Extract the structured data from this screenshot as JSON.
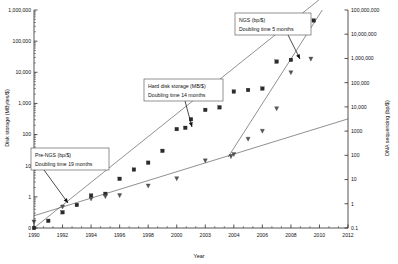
{
  "chart_data": {
    "type": "scatter",
    "title": "",
    "xlabel": "Year",
    "ylabel": "Disk storage (MBytes/$)",
    "y2label": "DNA sequencing (bp/$)",
    "grid": false,
    "legend": "none",
    "x_axis": {
      "label": "Year",
      "min": 1990,
      "max": 2012,
      "ticks": [
        "1990",
        "1992",
        "1994",
        "1996",
        "1998",
        "2000",
        "2003",
        "2004",
        "2006",
        "2008",
        "2010",
        "2012"
      ],
      "tick_values": [
        1990,
        1992,
        1994,
        1996,
        1998,
        2000,
        2002,
        2004,
        2006,
        2008,
        2010,
        2012
      ],
      "minor_ticks_per_interval": 2
    },
    "y_axis_left": {
      "label": "Disk storage (MBytes/$)",
      "scale": "log",
      "min": 0.1,
      "max": 1000000,
      "ticks": [
        "0",
        "1",
        "10",
        "100",
        "1,000",
        "10,000",
        "100,000",
        "1,000,000"
      ],
      "tick_values": [
        0.1,
        1,
        10,
        100,
        1000,
        10000,
        100000,
        1000000
      ]
    },
    "y_axis_right": {
      "label": "DNA sequencing (bp/$)",
      "scale": "log",
      "min": 0.1,
      "max": 100000000,
      "ticks": [
        "0.1",
        "1",
        "10",
        "100",
        "1000",
        "10,000",
        "100,000",
        "1,000,000",
        "10,000,000",
        "100,000,000"
      ],
      "tick_values": [
        0.1,
        1,
        10,
        100,
        1000,
        10000,
        100000,
        1000000,
        10000000,
        100000000
      ]
    },
    "series": [
      {
        "name": "Hard disk storage (MB/$)",
        "marker": "square",
        "axis": "left",
        "x": [
          1990,
          1991,
          1992,
          1993,
          1994,
          1995,
          1996,
          1997,
          1998,
          1999,
          2000,
          2000.6,
          2001,
          2002,
          2003,
          2004,
          2005,
          2006,
          2007,
          2008,
          2009,
          2009.6
        ],
        "y": [
          0.1,
          0.17,
          0.32,
          0.55,
          1.1,
          1.25,
          3.8,
          7.5,
          12.5,
          30,
          150,
          165,
          310,
          620,
          750,
          2400,
          2700,
          3000,
          22000,
          25000,
          260000,
          460000
        ]
      },
      {
        "name": "DNA sequencing (bp/$)",
        "marker": "triangle",
        "axis": "right",
        "x": [
          1990,
          1992,
          1994,
          1995,
          1996,
          1998,
          2000,
          2002,
          2003.8,
          2004,
          2005,
          2006,
          2007,
          2008,
          2009.4
        ],
        "y": [
          0.18,
          0.75,
          1.6,
          2.0,
          2.2,
          5.5,
          11,
          60,
          90,
          110,
          470,
          1000,
          8500,
          260000,
          950000
        ]
      }
    ],
    "trend_lines": [
      {
        "name": "Pre-NGS trend",
        "label": "Pre-NGS (bp/$)",
        "doubling_time": "Doubling time 19 months",
        "axis": "right",
        "x0": 1990,
        "y0": 0.32,
        "x1": 2012,
        "y1": 3200
      },
      {
        "name": "Hard disk trend",
        "label": "Hard disk storage (MB/$)",
        "doubling_time": "Doubling time 14 months",
        "axis": "left",
        "x0": 1990,
        "y0": 0.1,
        "x1": 2011.2,
        "y1": 6000000
      },
      {
        "name": "NGS trend",
        "label": "NGS (bp/$)",
        "doubling_time": "Doubling time 5 months",
        "axis": "right",
        "x0": 2003.6,
        "y0": 85,
        "x1": 2010.2,
        "y1": 100000000
      }
    ],
    "annotations": [
      {
        "id": "pre-ngs",
        "line1": "Pre-NGS (bp/$)",
        "line2": "Doubling time 19 months",
        "box": {
          "x": 31,
          "y": 148,
          "w": 78,
          "h": 22
        },
        "arrow_from": {
          "x": 44,
          "y": 170
        },
        "arrow_to": {
          "x": 68,
          "y": 203
        }
      },
      {
        "id": "hard-disk",
        "line1": "Hard disk storage (MB/$)",
        "line2": "Doubling time 14 months",
        "box": {
          "x": 144,
          "y": 79,
          "w": 79,
          "h": 22
        },
        "arrow_from": {
          "x": 185,
          "y": 101
        },
        "arrow_to": {
          "x": 192,
          "y": 127
        }
      },
      {
        "id": "ngs",
        "line1": "NGS (bp/$)",
        "line2": "Doubling time 5 months",
        "box": {
          "x": 235,
          "y": 13,
          "w": 76,
          "h": 22
        },
        "arrow_from": {
          "x": 288,
          "y": 35
        },
        "arrow_to": {
          "x": 300,
          "y": 59
        }
      }
    ]
  }
}
